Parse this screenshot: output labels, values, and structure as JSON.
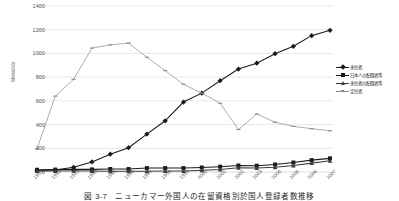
{
  "chart_data": {
    "type": "line",
    "title": "",
    "caption": "図 3-7　ニューカマー外国人の在留資格別於国人登録者数推移",
    "xlabel": "",
    "ylabel": "登録者数",
    "ylim": [
      0,
      1400
    ],
    "ytick_step": 200,
    "yticks": [
      0,
      200,
      400,
      600,
      800,
      1000,
      1200,
      1400
    ],
    "grid": true,
    "legend_position": "right",
    "unit_note": "千人",
    "categories": [
      "1991",
      "1992",
      "1993",
      "1994",
      "1995",
      "1996",
      "1997",
      "1998",
      "1999",
      "2000",
      "2001",
      "2002",
      "2003",
      "2004",
      "2005",
      "2006",
      "2007"
    ],
    "series": [
      {
        "name": "永住者",
        "marker": "diamond",
        "color": "#1a1a1a",
        "values": [
          10,
          16,
          40,
          85,
          150,
          205,
          320,
          432,
          590,
          665,
          770,
          868,
          918,
          998,
          1060,
          1150,
          1195
        ]
      },
      {
        "name": "日本人の配偶者等",
        "marker": "square",
        "color": "#1a1a1a",
        "values": [
          19,
          20,
          23,
          22,
          25,
          25,
          33,
          33,
          33,
          38,
          45,
          55,
          53,
          63,
          80,
          100,
          115
        ]
      },
      {
        "name": "永住者の配偶者等",
        "marker": "triangle",
        "color": "#3d3d3d",
        "values": [
          8,
          9,
          10,
          9,
          7,
          6,
          7,
          8,
          9,
          14,
          21,
          36,
          34,
          40,
          55,
          75,
          95
        ]
      },
      {
        "name": "定住者",
        "marker": "dash",
        "color": "#8a8a8a",
        "values": [
          196,
          640,
          782,
          1045,
          1072,
          1088,
          968,
          855,
          740,
          665,
          580,
          358,
          490,
          420,
          385,
          365,
          348
        ]
      }
    ]
  },
  "legend": {
    "items": [
      {
        "label": "永住者"
      },
      {
        "label": "日本人の配偶者等"
      },
      {
        "label": "永住者の配偶者等"
      },
      {
        "label": "定住者"
      }
    ]
  }
}
